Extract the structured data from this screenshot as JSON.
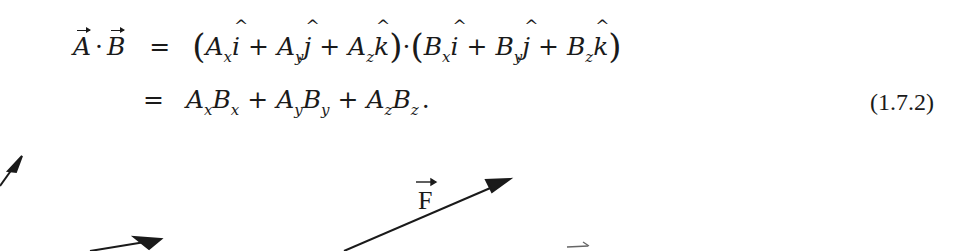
{
  "equation": {
    "number": "(1.7.2)",
    "line1": {
      "lhs_a": "A",
      "dot": "·",
      "lhs_b": "B",
      "equals": "=",
      "A_terms": [
        {
          "base": "A",
          "sub": "x",
          "unit": "i"
        },
        {
          "base": "A",
          "sub": "y",
          "unit": "j"
        },
        {
          "base": "A",
          "sub": "z",
          "unit": "k"
        }
      ],
      "B_terms": [
        {
          "base": "B",
          "sub": "x",
          "unit": "i"
        },
        {
          "base": "B",
          "sub": "y",
          "unit": "j"
        },
        {
          "base": "B",
          "sub": "z",
          "unit": "k"
        }
      ],
      "plus": "+",
      "open_paren": "(",
      "close_paren": ")"
    },
    "line2": {
      "equals": "=",
      "terms": [
        {
          "a": "A",
          "a_sub": "x",
          "b": "B",
          "b_sub": "x"
        },
        {
          "a": "A",
          "a_sub": "y",
          "b": "B",
          "b_sub": "y"
        },
        {
          "a": "A",
          "a_sub": "z",
          "b": "B",
          "b_sub": "z"
        }
      ],
      "plus": "+",
      "period": "."
    }
  },
  "figure": {
    "force_label": "F",
    "stroke_color": "#1a1a1a"
  }
}
